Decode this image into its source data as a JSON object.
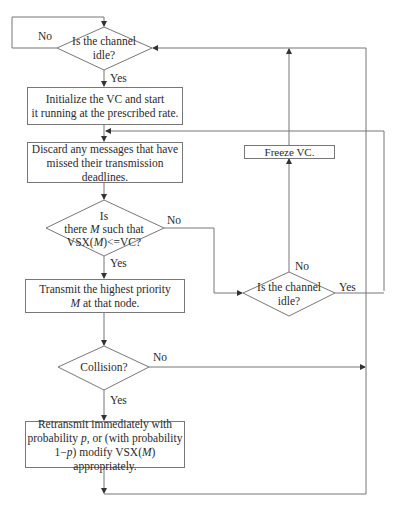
{
  "diagram": {
    "type": "flowchart",
    "nodes": {
      "idle_check_1": {
        "line1": "Is the channel",
        "line2": "idle?"
      },
      "init_vc": {
        "line1": "Initialize the VC and start",
        "line2": "it running at the prescribed rate."
      },
      "discard": {
        "line1": "Discard any messages that have",
        "line2": "missed their transmission deadlines."
      },
      "vsx_check": {
        "line1": "Is",
        "line2_pre": "there ",
        "line2_var": "M",
        "line2_post": " such that",
        "line3_pre": "VSX(",
        "line3_var": "M",
        "line3_post": ")<=VC?"
      },
      "transmit": {
        "line1": "Transmit the highest priority",
        "line2_var": "M",
        "line2_post": " at that node."
      },
      "collision": {
        "line1": "Collision?"
      },
      "retransmit": {
        "line1": "Retransmit immediately with",
        "line2_pre": "probability ",
        "line2_var": "p",
        "line2_post": ", or (with  probability",
        "line3_pre": "1−",
        "line3_var": "p",
        "line3_post": ") modify VSX(",
        "line3_var2": "M",
        "line3_post2": ") appropriately."
      },
      "idle_check_2": {
        "line1": "Is the channel",
        "line2": "idle?"
      },
      "freeze": {
        "line1": "Freeze VC."
      }
    },
    "edge_labels": {
      "idle1_no": "No",
      "idle1_yes": "Yes",
      "vsx_no": "No",
      "vsx_yes": "Yes",
      "collision_no": "No",
      "collision_yes": "Yes",
      "idle2_no": "No",
      "idle2_yes": "Yes"
    },
    "colors": {
      "line": "#666666",
      "text": "#2a2a2a"
    }
  }
}
